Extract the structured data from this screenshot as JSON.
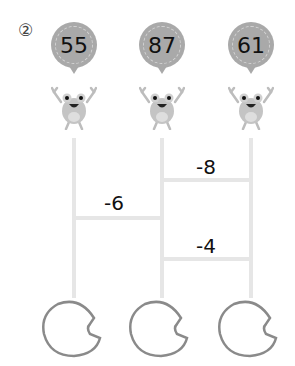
{
  "problem": {
    "number": "②"
  },
  "ladder": {
    "columns": [
      {
        "id": "left",
        "start_value": "55",
        "answer": ""
      },
      {
        "id": "middle",
        "start_value": "87",
        "answer": ""
      },
      {
        "id": "right",
        "start_value": "61",
        "answer": ""
      }
    ],
    "rungs": [
      {
        "between": "middle-right",
        "label": "-8",
        "position": "upper"
      },
      {
        "between": "left-middle",
        "label": "-6",
        "position": "middle"
      },
      {
        "between": "middle-right",
        "label": "-4",
        "position": "lower"
      }
    ]
  },
  "colors": {
    "bubble": "#a9a9a9",
    "line": "#e6e6e6",
    "frog": "#bdbdbd",
    "pad_outline": "#8a8a8a"
  }
}
